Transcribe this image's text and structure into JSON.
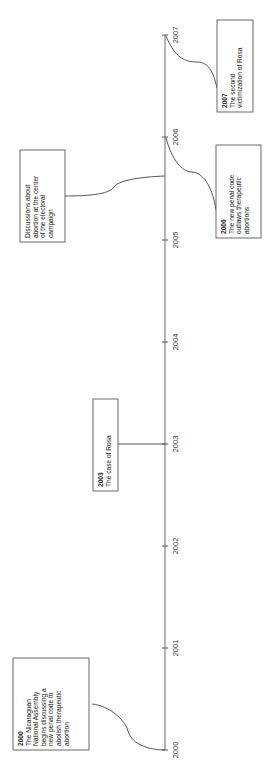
{
  "diagram": {
    "type": "vertical-timeline",
    "axis": {
      "x": 165,
      "y_start": 35,
      "y_end": 750,
      "color": "#6a6a6a"
    },
    "ticks": [
      {
        "label": "2007",
        "y": 35
      },
      {
        "label": "2006",
        "y": 137
      },
      {
        "label": "2005",
        "y": 240
      },
      {
        "label": "2004",
        "y": 342
      },
      {
        "label": "2003",
        "y": 444
      },
      {
        "label": "2002",
        "y": 546
      },
      {
        "label": "2001",
        "y": 648
      },
      {
        "label": "2000",
        "y": 750
      }
    ],
    "events": [
      {
        "id": "event-2007",
        "year": "2007",
        "lines": [
          "The second",
          "victimization of Rosa"
        ],
        "box": {
          "x": 217,
          "y": 20,
          "w": 36,
          "h": 92
        },
        "connector": "M166,36 C175,58 185,62 197,62 C210,62 214,75 217,88"
      },
      {
        "id": "event-2006",
        "year": "2006",
        "lines": [
          "The new penal code",
          "outlaws therapeutic",
          "abortions"
        ],
        "box": {
          "x": 216,
          "y": 145,
          "w": 45,
          "h": 93
        },
        "connector": "M166,138 C172,160 182,172 192,172 C205,173 213,190 216,210"
      },
      {
        "id": "event-2005-campaign",
        "year": "",
        "lines": [
          "Discussions about",
          "abortion at the center",
          "of the electoral",
          "campaign"
        ],
        "box": {
          "x": 20,
          "y": 150,
          "w": 45,
          "h": 92
        },
        "connector": "M65,196 C90,196 108,194 113,188 C118,180 140,177 165,176"
      },
      {
        "id": "event-2003",
        "year": "2003",
        "lines": [
          "The case of Rosa"
        ],
        "box": {
          "x": 93,
          "y": 399,
          "w": 25,
          "h": 92
        },
        "connector": "M118,444 L165,444"
      },
      {
        "id": "event-2000",
        "year": "2000",
        "lines": [
          "The Nicaraguan",
          "National Assembly",
          "begins discussing a",
          "new penal code to",
          "abolish therapeutic",
          "abortion"
        ],
        "box": {
          "x": 13,
          "y": 658,
          "w": 76,
          "h": 92
        },
        "connector": "M92,704 C110,706 125,720 128,731 C132,745 150,750 165,750"
      }
    ]
  }
}
